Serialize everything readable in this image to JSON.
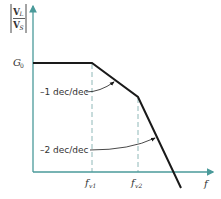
{
  "diagram": {
    "type": "bode-magnitude-asymptotic-plot",
    "colors": {
      "axis": "#4a9a9a",
      "curve": "#1a1a1a",
      "dashed": "#8fb8b8",
      "text": "#333333"
    },
    "y_axis": {
      "label_numerator": "V",
      "label_numerator_sub": "L",
      "label_denominator": "V",
      "label_denominator_sub": "S",
      "tick_label": "G",
      "tick_label_sub": "0"
    },
    "x_axis": {
      "label": "f",
      "ticks": [
        {
          "label": "f",
          "sub": "v1"
        },
        {
          "label": "f",
          "sub": "v2"
        }
      ]
    },
    "annotations": [
      {
        "text": "–1 dec/dec"
      },
      {
        "text": "–2 dec/dec"
      }
    ]
  }
}
